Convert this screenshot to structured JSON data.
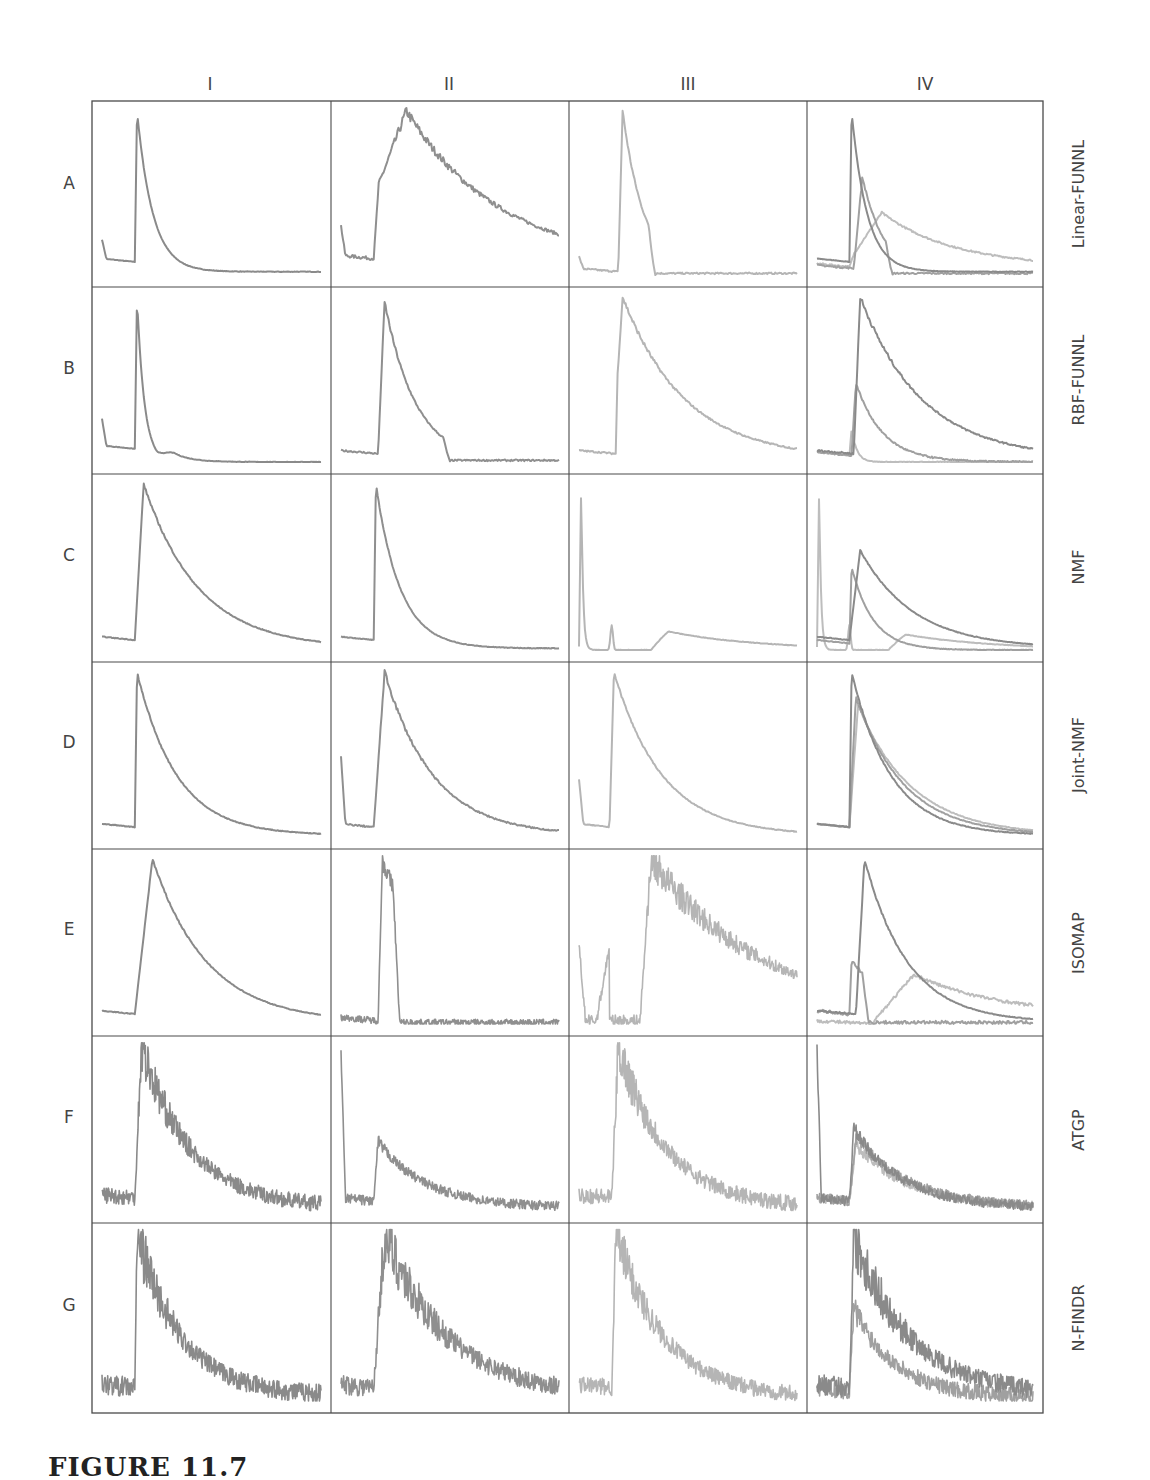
{
  "figure": {
    "caption": "FIGURE 11.7",
    "columns": [
      "I",
      "II",
      "III",
      "IV"
    ],
    "rows": [
      {
        "letter": "A",
        "method": "Linear-FUNNL"
      },
      {
        "letter": "B",
        "method": "RBF-FUNNL"
      },
      {
        "letter": "C",
        "method": "NMF"
      },
      {
        "letter": "D",
        "method": "Joint-NMF"
      },
      {
        "letter": "E",
        "method": "ISOMAP"
      },
      {
        "letter": "F",
        "method": "ATGP"
      },
      {
        "letter": "G",
        "method": "N-FINDR"
      }
    ],
    "colors": {
      "frame": "#4a4a4a",
      "I": "#8a8a8a",
      "II": "#8f8f8f",
      "III": "#b5b5b5",
      "IV_dark": "#8a8a8a",
      "IV_mid": "#a0a0a0",
      "IV_light": "#bdbdbd"
    }
  },
  "chart_data": {
    "type": "line",
    "layout": "7 rows x 4 columns grid of small multiples, no axis ticks",
    "xlabel": "",
    "ylabel": "",
    "grid": false,
    "note": "Each curve described by shape params (normalized x in [0,1], y in [0,1]): baseline level, onset x, peak x, peak height, decay rate, noise amplitude, optional early spike",
    "panels": [
      {
        "row": "A",
        "col": "I",
        "curves": [
          {
            "base": 0.08,
            "onset": 0.15,
            "peak": 0.16,
            "h": 1.0,
            "decay": 14,
            "tail": 0.02,
            "noise": 0.003,
            "spike0": 0.13
          }
        ]
      },
      {
        "row": "A",
        "col": "II",
        "curves": [
          {
            "base": 0.1,
            "onset": 0.15,
            "peak": 0.3,
            "h": 1.0,
            "decay": 2.3,
            "tail": 0.06,
            "noise": 0.02,
            "rise_plateau": 0.5,
            "spike0": 0.2
          }
        ]
      },
      {
        "row": "A",
        "col": "III",
        "curves": [
          {
            "base": 0.02,
            "onset": 0.18,
            "peak": 0.2,
            "h": 1.0,
            "decay": 10,
            "tail": 0.0,
            "noise": 0.01,
            "cutoff": 0.35,
            "spike0": 0.08
          }
        ]
      },
      {
        "row": "A",
        "col": "IV",
        "curves": [
          {
            "base": 0.08,
            "onset": 0.15,
            "peak": 0.16,
            "h": 1.0,
            "decay": 14,
            "tail": 0.02,
            "noise": 0.003
          },
          {
            "base": 0.04,
            "onset": 0.17,
            "peak": 0.21,
            "h": 0.6,
            "decay": 10,
            "tail": 0.0,
            "noise": 0.01,
            "cutoff": 0.35
          },
          {
            "base": 0.05,
            "onset": 0.15,
            "peak": 0.3,
            "h": 0.38,
            "decay": 3,
            "tail": 0.05,
            "noise": 0.01,
            "rise_plateau": 0.25
          }
        ]
      },
      {
        "row": "B",
        "col": "I",
        "curves": [
          {
            "base": 0.08,
            "onset": 0.15,
            "peak": 0.16,
            "h": 1.0,
            "decay": 30,
            "tail": 0.0,
            "noise": 0.003,
            "bump": {
              "x": 0.3,
              "h": 0.07,
              "w": 0.1
            },
            "spike0": 0.18
          }
        ]
      },
      {
        "row": "B",
        "col": "II",
        "curves": [
          {
            "base": 0.05,
            "onset": 0.17,
            "peak": 0.2,
            "h": 0.97,
            "decay": 7,
            "tail": 0.0,
            "noise": 0.01,
            "cutoff": 0.5
          }
        ]
      },
      {
        "row": "B",
        "col": "III",
        "curves": [
          {
            "base": 0.05,
            "onset": 0.17,
            "peak": 0.2,
            "h": 1.0,
            "decay": 3.5,
            "tail": 0.02,
            "noise": 0.01,
            "rise_plateau": 0.45
          }
        ]
      },
      {
        "row": "B",
        "col": "IV",
        "curves": [
          {
            "base": 0.05,
            "onset": 0.17,
            "peak": 0.2,
            "h": 1.0,
            "decay": 3.5,
            "tail": 0.02,
            "noise": 0.01
          },
          {
            "base": 0.04,
            "onset": 0.16,
            "peak": 0.18,
            "h": 0.48,
            "decay": 8,
            "tail": 0.0,
            "noise": 0.01
          },
          {
            "base": 0.04,
            "onset": 0.15,
            "peak": 0.16,
            "h": 0.2,
            "decay": 40,
            "tail": 0.0,
            "noise": 0.005
          }
        ]
      },
      {
        "row": "C",
        "col": "I",
        "curves": [
          {
            "base": 0.06,
            "onset": 0.15,
            "peak": 0.19,
            "h": 1.0,
            "decay": 4,
            "tail": 0.01,
            "noise": 0.005
          }
        ]
      },
      {
        "row": "C",
        "col": "II",
        "curves": [
          {
            "base": 0.06,
            "onset": 0.15,
            "peak": 0.16,
            "h": 1.0,
            "decay": 9,
            "tail": 0.01,
            "noise": 0.004
          }
        ]
      },
      {
        "row": "C",
        "col": "III",
        "curves": [
          {
            "base": 0.02,
            "onset": 0.0,
            "peak": 0.01,
            "h": 1.0,
            "decay": 120,
            "tail": 0.0,
            "noise": 0.003,
            "bump": {
              "x": 0.38,
              "h": 0.12,
              "w": 0.5
            },
            "minor_peak": {
              "x": 0.15,
              "h": 0.15
            }
          }
        ]
      },
      {
        "row": "C",
        "col": "IV",
        "curves": [
          {
            "base": 0.06,
            "onset": 0.15,
            "peak": 0.2,
            "h": 0.6,
            "decay": 4,
            "tail": 0.01,
            "noise": 0.004
          },
          {
            "base": 0.04,
            "onset": 0.15,
            "peak": 0.16,
            "h": 0.5,
            "decay": 10,
            "tail": 0.0,
            "noise": 0.004
          },
          {
            "base": 0.02,
            "onset": 0.0,
            "peak": 0.01,
            "h": 1.0,
            "decay": 120,
            "tail": 0.0,
            "noise": 0.003,
            "bump": {
              "x": 0.38,
              "h": 0.1,
              "w": 0.5
            },
            "minor_peak": {
              "x": 0.15,
              "h": 0.15
            }
          }
        ]
      },
      {
        "row": "D",
        "col": "I",
        "curves": [
          {
            "base": 0.06,
            "onset": 0.15,
            "peak": 0.16,
            "h": 1.0,
            "decay": 5.5,
            "tail": 0.01,
            "noise": 0.005,
            "shoulder": 0.82
          }
        ]
      },
      {
        "row": "D",
        "col": "II",
        "curves": [
          {
            "base": 0.06,
            "onset": 0.15,
            "peak": 0.2,
            "h": 1.0,
            "decay": 4.5,
            "tail": 0.01,
            "noise": 0.01,
            "spike0": 0.45
          }
        ]
      },
      {
        "row": "D",
        "col": "III",
        "curves": [
          {
            "base": 0.06,
            "onset": 0.14,
            "peak": 0.16,
            "h": 1.0,
            "decay": 4.5,
            "tail": 0.01,
            "noise": 0.005,
            "spike0": 0.3
          }
        ]
      },
      {
        "row": "D",
        "col": "IV",
        "curves": [
          {
            "base": 0.06,
            "onset": 0.15,
            "peak": 0.16,
            "h": 1.0,
            "decay": 5.5,
            "tail": 0.01,
            "noise": 0.005
          },
          {
            "base": 0.06,
            "onset": 0.15,
            "peak": 0.18,
            "h": 0.85,
            "decay": 4.5,
            "tail": 0.01,
            "noise": 0.005
          },
          {
            "base": 0.06,
            "onset": 0.15,
            "peak": 0.19,
            "h": 0.8,
            "decay": 4,
            "tail": 0.01,
            "noise": 0.005
          }
        ]
      },
      {
        "row": "E",
        "col": "I",
        "curves": [
          {
            "base": 0.06,
            "onset": 0.15,
            "peak": 0.23,
            "h": 1.0,
            "decay": 4,
            "tail": 0.01,
            "noise": 0.005
          }
        ]
      },
      {
        "row": "E",
        "col": "II",
        "curves": [
          {
            "base": 0.02,
            "onset": 0.17,
            "peak": 0.19,
            "h": 1.0,
            "decay": 4,
            "tail": 0.0,
            "noise": 0.04,
            "cutoff": 0.27
          }
        ]
      },
      {
        "row": "E",
        "col": "III",
        "curves": [
          {
            "base": 0.02,
            "onset": 0.28,
            "peak": 0.33,
            "h": 1.0,
            "decay": 2,
            "tail": 0.05,
            "noise": 0.07,
            "spike0": 0.5,
            "early_ramp": {
              "start": 0.08,
              "end": 0.14,
              "h": 0.45
            }
          }
        ]
      },
      {
        "row": "E",
        "col": "IV",
        "curves": [
          {
            "base": 0.06,
            "onset": 0.18,
            "peak": 0.22,
            "h": 1.0,
            "decay": 5,
            "tail": 0.01,
            "noise": 0.005
          },
          {
            "base": 0.06,
            "onset": 0.15,
            "peak": 0.16,
            "h": 0.38,
            "decay": 4,
            "tail": 0.0,
            "noise": 0.02,
            "cutoff": 0.24
          },
          {
            "base": 0.0,
            "onset": 0.25,
            "peak": 0.45,
            "h": 0.3,
            "decay": 2.5,
            "tail": 0.05,
            "noise": 0.02
          }
        ]
      },
      {
        "row": "F",
        "col": "I",
        "curves": [
          {
            "base": 0.08,
            "onset": 0.15,
            "peak": 0.18,
            "h": 1.0,
            "decay": 4.5,
            "tail": 0.02,
            "noise": 0.1
          }
        ]
      },
      {
        "row": "F",
        "col": "II",
        "curves": [
          {
            "base": 0.06,
            "onset": 0.15,
            "peak": 0.17,
            "h": 0.42,
            "decay": 4.5,
            "tail": 0.02,
            "noise": 0.06,
            "spike0": 1.0
          }
        ]
      },
      {
        "row": "F",
        "col": "III",
        "curves": [
          {
            "base": 0.08,
            "onset": 0.15,
            "peak": 0.18,
            "h": 1.0,
            "decay": 4.5,
            "tail": 0.02,
            "noise": 0.1
          }
        ]
      },
      {
        "row": "F",
        "col": "IV",
        "curves": [
          {
            "base": 0.06,
            "onset": 0.15,
            "peak": 0.17,
            "h": 0.5,
            "decay": 4.5,
            "tail": 0.02,
            "noise": 0.06,
            "spike0": 1.0
          },
          {
            "base": 0.06,
            "onset": 0.15,
            "peak": 0.18,
            "h": 0.45,
            "decay": 4,
            "tail": 0.02,
            "noise": 0.06
          },
          {
            "base": 0.06,
            "onset": 0.15,
            "peak": 0.18,
            "h": 0.4,
            "decay": 4,
            "tail": 0.02,
            "noise": 0.06
          }
        ]
      },
      {
        "row": "G",
        "col": "I",
        "curves": [
          {
            "base": 0.08,
            "onset": 0.15,
            "peak": 0.16,
            "h": 1.0,
            "decay": 5,
            "tail": 0.03,
            "noise": 0.12
          }
        ]
      },
      {
        "row": "G",
        "col": "II",
        "curves": [
          {
            "base": 0.08,
            "onset": 0.15,
            "peak": 0.2,
            "h": 1.0,
            "decay": 3.5,
            "tail": 0.03,
            "noise": 0.12
          }
        ]
      },
      {
        "row": "G",
        "col": "III",
        "curves": [
          {
            "base": 0.08,
            "onset": 0.15,
            "peak": 0.17,
            "h": 1.0,
            "decay": 4.5,
            "tail": 0.02,
            "noise": 0.1
          }
        ]
      },
      {
        "row": "G",
        "col": "IV",
        "curves": [
          {
            "base": 0.08,
            "onset": 0.15,
            "peak": 0.17,
            "h": 1.0,
            "decay": 4,
            "tail": 0.04,
            "noise": 0.12
          },
          {
            "base": 0.06,
            "onset": 0.15,
            "peak": 0.17,
            "h": 0.55,
            "decay": 5,
            "tail": 0.02,
            "noise": 0.1
          }
        ]
      }
    ]
  }
}
